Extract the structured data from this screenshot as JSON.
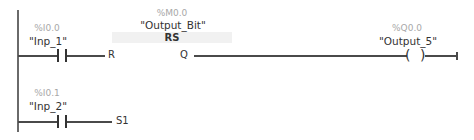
{
  "diagram": {
    "type": "ladder-logic",
    "rungs": [
      {
        "contact": {
          "address": "%I0.0",
          "tag": "\"Inp_1\"",
          "pin": "R"
        },
        "block": {
          "address": "%M0.0",
          "tag": "\"Output_Bit\"",
          "type": "RS",
          "output_pin": "Q"
        },
        "coil": {
          "address": "%Q0.0",
          "tag": "\"Output_5\"",
          "symbol_left": "(",
          "symbol_right": ")"
        }
      },
      {
        "contact": {
          "address": "%I0.1",
          "tag": "\"Inp_2\"",
          "pin": "S1"
        }
      }
    ]
  },
  "colors": {
    "wire": "#4a4a4a",
    "address_text": "#a8a8a8",
    "tag_text": "#333333",
    "rs_header_bg": "#f1f1f1"
  }
}
